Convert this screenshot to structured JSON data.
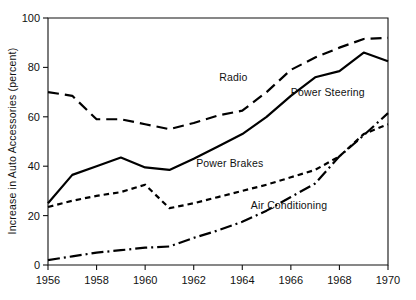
{
  "chart_data": {
    "type": "line",
    "title": "",
    "subtitle": "",
    "xlabel": "",
    "ylabel": "Increase in Auto Accessories (percent)",
    "xlim": [
      1956,
      1970
    ],
    "ylim": [
      0,
      100
    ],
    "grid": false,
    "legend_position": "inline-annotations",
    "x": [
      1956,
      1957,
      1958,
      1959,
      1960,
      1961,
      1962,
      1963,
      1964,
      1965,
      1966,
      1967,
      1968,
      1969,
      1970
    ],
    "x_tick_labels": [
      "1956",
      "1958",
      "1960",
      "1962",
      "1964",
      "1966",
      "1968",
      "1970"
    ],
    "x_ticks": [
      1956,
      1958,
      1960,
      1962,
      1964,
      1966,
      1968,
      1970
    ],
    "y_ticks": [
      0,
      20,
      40,
      60,
      80,
      100
    ],
    "y_tick_labels": [
      "0",
      "20",
      "40",
      "60",
      "80",
      "100"
    ],
    "series": [
      {
        "name": "Radio",
        "line_style": "long-dash",
        "dash_pattern": "11,6",
        "label": "Radio",
        "label_x": 1963.05,
        "label_y": 74.5,
        "values": [
          70,
          68.5,
          59,
          59,
          57,
          55,
          57.5,
          60.5,
          62.5,
          70,
          79,
          84,
          88,
          91.5,
          92
        ]
      },
      {
        "name": "Power Steering",
        "line_style": "solid",
        "dash_pattern": "none",
        "label": "Power Steering",
        "label_x": 1966.0,
        "label_y": 68.5,
        "values": [
          25,
          36.5,
          40,
          43.5,
          39.5,
          38.5,
          43,
          48,
          53,
          60,
          68.5,
          76,
          78.5,
          86,
          82.5
        ]
      },
      {
        "name": "Power Brakes",
        "line_style": "short-dash",
        "dash_pattern": "5.5,4",
        "label": "Power Brakes",
        "label_x": 1962.1,
        "label_y": 39.5,
        "values": [
          23.5,
          26,
          28,
          29.5,
          32.5,
          23,
          25,
          27.5,
          30,
          32.5,
          35.5,
          38.5,
          44,
          53,
          57
        ]
      },
      {
        "name": "Air Conditioning",
        "line_style": "dash-dot",
        "dash_pattern": "12,4,2,4",
        "label": "Air Conditioning",
        "label_x": 1964.35,
        "label_y": 22.5,
        "values": [
          2,
          3.5,
          5,
          6,
          7,
          7.5,
          11,
          14,
          17.5,
          22,
          27.5,
          33,
          44,
          52.5,
          61.5
        ]
      }
    ],
    "colors": {
      "line": "#000000",
      "axis": "#111111",
      "text": "#111111",
      "background": "#ffffff"
    }
  }
}
